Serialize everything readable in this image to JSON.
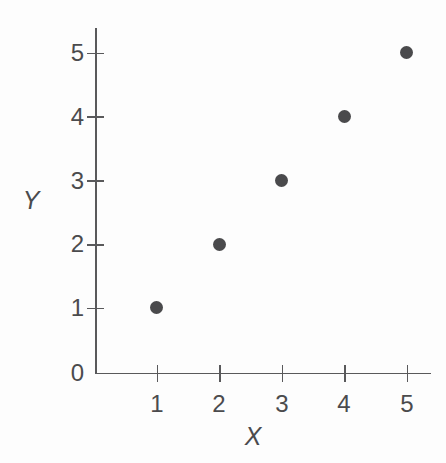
{
  "chart_data": {
    "type": "scatter",
    "title": "",
    "xlabel": "X",
    "ylabel": "Y",
    "x": [
      1,
      2,
      3,
      4,
      5
    ],
    "y": [
      1,
      2,
      3,
      4,
      5
    ],
    "points": [
      {
        "x": 1,
        "y": 1
      },
      {
        "x": 2,
        "y": 2
      },
      {
        "x": 3,
        "y": 3
      },
      {
        "x": 4,
        "y": 4
      },
      {
        "x": 5,
        "y": 5
      }
    ],
    "xlim": [
      0,
      5.4
    ],
    "ylim": [
      0,
      5.4
    ],
    "xticks": [
      1,
      2,
      3,
      4,
      5
    ],
    "yticks": [
      0,
      1,
      2,
      3,
      4,
      5
    ],
    "xtick_labels": [
      "1",
      "2",
      "3",
      "4",
      "5"
    ],
    "ytick_labels": [
      "0",
      "1",
      "2",
      "3",
      "4",
      "5"
    ],
    "grid": false,
    "legend": null,
    "marker_color": "#4a4a4c",
    "axis_color": "#59595b",
    "text_color": "#4b4b4d",
    "background_color": "#fdfdfd"
  },
  "axes": {
    "x_title": "X",
    "y_title": "Y"
  },
  "y_tick_labels": {
    "t0": "0",
    "t1": "1",
    "t2": "2",
    "t3": "3",
    "t4": "4",
    "t5": "5"
  },
  "x_tick_labels": {
    "t1": "1",
    "t2": "2",
    "t3": "3",
    "t4": "4",
    "t5": "5"
  }
}
